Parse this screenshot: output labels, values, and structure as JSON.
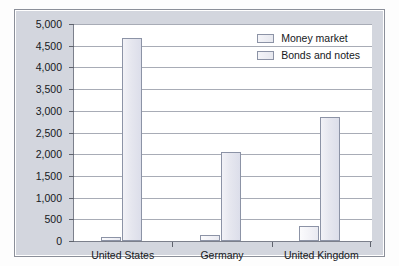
{
  "chart_data": {
    "type": "bar",
    "title": "",
    "subtitle": "",
    "xlabel": "",
    "ylabel": "",
    "categories": [
      "United States",
      "Germany",
      "United Kingdom"
    ],
    "series": [
      {
        "name": "Money market",
        "values": [
          100,
          150,
          335
        ],
        "color": "#f1f1f6"
      },
      {
        "name": "Bonds and notes",
        "values": [
          4670,
          2060,
          2850
        ],
        "color": "#e6e7ef"
      }
    ],
    "ylim": [
      0,
      5000
    ],
    "ytick_values": [
      0,
      500,
      1000,
      1500,
      2000,
      2500,
      3000,
      3500,
      4000,
      4500,
      5000
    ],
    "ytick_labels": [
      "0",
      "500",
      "1,000",
      "1,500",
      "2,000",
      "2,500",
      "3,000",
      "3,500",
      "4,000",
      "4,500",
      "5,000"
    ],
    "grid": true,
    "grid_axis": "y",
    "legend_position": "top-right"
  },
  "legend": {
    "items": [
      {
        "label": "Money market"
      },
      {
        "label": "Bonds and notes"
      }
    ]
  },
  "axes": {
    "y": {
      "labels": [
        "5,000",
        "4,500",
        "4,000",
        "3,500",
        "3,000",
        "2,500",
        "2,000",
        "1,500",
        "1,000",
        "500",
        "0"
      ]
    },
    "x": {
      "labels": [
        "United States",
        "Germany",
        "United Kingdom"
      ]
    }
  },
  "colors": {
    "frame_background": "#d3d6de",
    "frame_border": "#8b8f99",
    "panel_background": "#ffffff",
    "gridline": "#a8acb6",
    "axis": "#7c808c",
    "bar_fill": "#e6e7ef",
    "bar_border": "#8c93a6",
    "text": "#16181c"
  }
}
